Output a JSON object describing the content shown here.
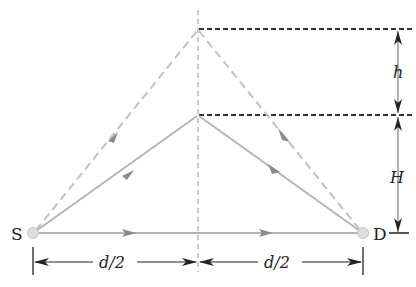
{
  "diagram": {
    "nodes": {
      "source": {
        "label": "S",
        "x": 33,
        "y": 233
      },
      "detector": {
        "label": "D",
        "x": 363,
        "y": 233
      },
      "lower_peak": {
        "x": 198,
        "y": 115
      },
      "upper_peak": {
        "x": 198,
        "y": 29
      }
    },
    "labels": {
      "height_H": "H",
      "height_h": "h",
      "half_distance_left": "d/2",
      "half_distance_right": "d/2"
    },
    "colors": {
      "ray_solid": "#b5b5b5",
      "ray_dashed": "#c2c2c2",
      "arrowhead": "#8a8a8a",
      "dimension": "#222222",
      "guide_dotted": "#333333",
      "node_fill": "#dddddd"
    },
    "paths": [
      {
        "name": "direct-path",
        "style": "solid",
        "from": "source",
        "to": "detector"
      },
      {
        "name": "reflected-path-H",
        "style": "solid",
        "via": "lower_peak"
      },
      {
        "name": "reflected-path-H-plus-h",
        "style": "dashed",
        "via": "upper_peak"
      }
    ]
  }
}
